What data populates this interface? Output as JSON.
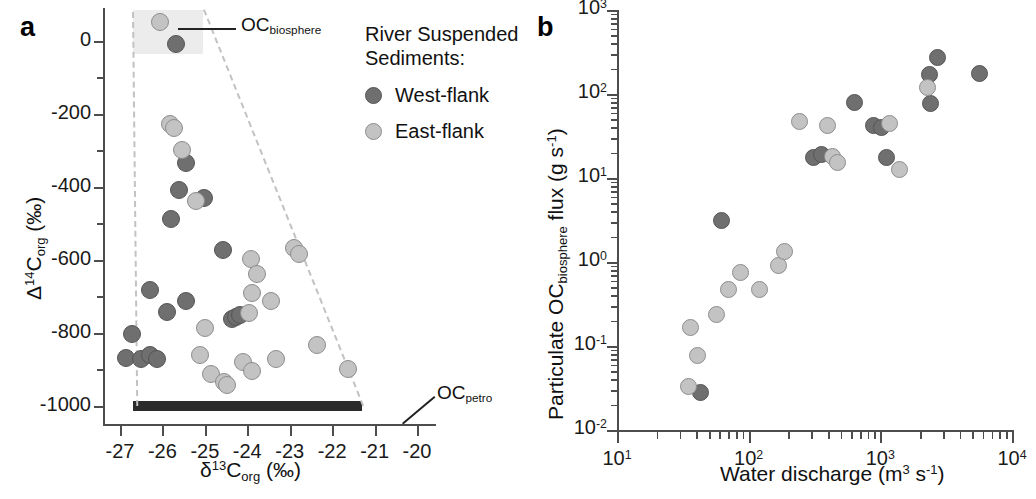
{
  "figure": {
    "panels": [
      {
        "letter": "a"
      },
      {
        "letter": "b"
      }
    ]
  },
  "legend": {
    "title_line1": "River Suspended",
    "title_line2": "Sediments:",
    "items": [
      {
        "label": "West-flank",
        "key": "west",
        "color": "#6f6f6f"
      },
      {
        "label": "East-flank",
        "key": "east",
        "color": "#c3c3c3"
      }
    ]
  },
  "panel_a": {
    "letter": "a",
    "annotations": [
      {
        "name": "oc-biosphere-label",
        "text_main": "OC",
        "text_sub": "biosphere"
      },
      {
        "name": "oc-petro-label",
        "text_main": "OC",
        "text_sub": "petro"
      }
    ],
    "x_axis": {
      "title_parts": {
        "delta": "δ",
        "sup": "13",
        "c": "C",
        "sub": "org",
        "units": "(‰)"
      },
      "ticks": [
        "-27",
        "-26",
        "-25",
        "-24",
        "-23",
        "-22",
        "-21",
        "-20"
      ],
      "min": -27.4,
      "max": -19.6
    },
    "y_axis": {
      "title_parts": {
        "delta": "Δ",
        "sup": "14",
        "c": "C",
        "sub": "org",
        "units": "(‰)"
      },
      "ticks": [
        "0",
        "-200",
        "-400",
        "-600",
        "-800",
        "-1000"
      ],
      "min": -1050,
      "max": 90
    }
  },
  "panel_b": {
    "letter": "b",
    "x_axis": {
      "title_parts": {
        "text": "Water discharge (m",
        "sup1": "3",
        "mid": " s",
        "sup2": "-1",
        "end": ")"
      },
      "ticks": [
        "10¹",
        "10²",
        "10³",
        "10⁴"
      ],
      "tick_exponents": [
        "1",
        "2",
        "3",
        "4"
      ],
      "min_exp": 1,
      "max_exp": 4
    },
    "y_axis": {
      "title_parts": {
        "lead": "Particulate OC",
        "sub": "biosphere",
        "tail": " flux (g s",
        "sup": "-1",
        "end": ")"
      },
      "ticks": [
        "10⁻²",
        "10⁻¹",
        "10⁰",
        "10¹",
        "10²",
        "10³"
      ],
      "tick_exponents": [
        "-2",
        "-1",
        "0",
        "1",
        "2",
        "3"
      ],
      "min_exp": -2,
      "max_exp": 3
    }
  },
  "chart_data": [
    {
      "type": "scatter",
      "panel": "a",
      "title": "",
      "xlabel": "δ13Corg (‰)",
      "ylabel": "Δ14Corg (‰)",
      "xlim": [
        -27.4,
        -19.6
      ],
      "ylim": [
        -1050,
        90
      ],
      "grid": false,
      "legend_position": "outside-right-top",
      "annotations": [
        {
          "label": "OCbiosphere",
          "x": -23.0,
          "y": 35,
          "note": "shaded endmember box upper-left"
        },
        {
          "label": "OCpetro",
          "x": -20.9,
          "y": -950,
          "note": "black bar along -1000 line"
        }
      ],
      "shaded_box": {
        "x0": -26.7,
        "x1": -25.05,
        "y0": -35,
        "y1": 85
      },
      "mixing_lines": [
        {
          "from": [
            -26.72,
            80
          ],
          "to": [
            -26.62,
            -1000
          ]
        },
        {
          "from": [
            -25.05,
            85
          ],
          "to": [
            -21.3,
            -1000
          ]
        }
      ],
      "petro_bar": {
        "x0": -26.7,
        "x1": -21.3,
        "y": -1000
      },
      "series": [
        {
          "name": "West-flank",
          "color": "#6f6f6f",
          "points": [
            [
              -25.68,
              -8
            ],
            [
              -25.45,
              -335
            ],
            [
              -25.62,
              -410
            ],
            [
              -25.02,
              -432
            ],
            [
              -25.8,
              -487
            ],
            [
              -24.58,
              -572
            ],
            [
              -26.3,
              -682
            ],
            [
              -25.45,
              -712
            ],
            [
              -25.9,
              -742
            ],
            [
              -24.36,
              -762
            ],
            [
              -24.26,
              -757
            ],
            [
              -24.17,
              -752
            ],
            [
              -26.72,
              -803
            ],
            [
              -26.85,
              -868
            ],
            [
              -26.5,
              -872
            ],
            [
              -26.3,
              -862
            ],
            [
              -26.12,
              -872
            ]
          ]
        },
        {
          "name": "East-flank",
          "color": "#c3c3c3",
          "points": [
            [
              -26.05,
              52
            ],
            [
              -25.82,
              -228
            ],
            [
              -25.72,
              -240
            ],
            [
              -25.55,
              -298
            ],
            [
              -25.22,
              -438
            ],
            [
              -23.92,
              -598
            ],
            [
              -22.9,
              -568
            ],
            [
              -22.78,
              -583
            ],
            [
              -23.78,
              -640
            ],
            [
              -23.9,
              -690
            ],
            [
              -23.45,
              -712
            ],
            [
              -23.97,
              -745
            ],
            [
              -25.0,
              -787
            ],
            [
              -25.12,
              -862
            ],
            [
              -22.35,
              -833
            ],
            [
              -23.32,
              -872
            ],
            [
              -21.62,
              -898
            ],
            [
              -24.86,
              -912
            ],
            [
              -24.1,
              -880
            ],
            [
              -23.9,
              -905
            ],
            [
              -24.55,
              -935
            ],
            [
              -24.48,
              -942
            ]
          ]
        }
      ]
    },
    {
      "type": "scatter",
      "panel": "b",
      "title": "",
      "xlabel": "Water discharge (m3 s-1)",
      "ylabel": "Particulate OCbiosphere flux (g s-1)",
      "x_log": true,
      "y_log": true,
      "xlim": [
        10,
        10000
      ],
      "ylim": [
        0.01,
        1000
      ],
      "grid": false,
      "series": [
        {
          "name": "West-flank",
          "color": "#6f6f6f",
          "points": [
            [
              43,
              0.028
            ],
            [
              62,
              3.1
            ],
            [
              310,
              17.5
            ],
            [
              355,
              19.0
            ],
            [
              640,
              80
            ],
            [
              880,
              42
            ],
            [
              1020,
              40
            ],
            [
              1120,
              17.5
            ],
            [
              2350,
              170
            ],
            [
              2700,
              270
            ],
            [
              2400,
              78
            ],
            [
              5700,
              175
            ]
          ]
        },
        {
          "name": "East-flank",
          "color": "#c3c3c3",
          "points": [
            [
              35,
              0.033
            ],
            [
              41,
              0.077
            ],
            [
              36,
              0.165
            ],
            [
              57,
              0.24
            ],
            [
              70,
              0.47
            ],
            [
              86,
              0.76
            ],
            [
              120,
              0.47
            ],
            [
              168,
              0.9
            ],
            [
              188,
              1.35
            ],
            [
              245,
              47
            ],
            [
              395,
              42
            ],
            [
              430,
              18.0
            ],
            [
              470,
              15.5
            ],
            [
              1180,
              45
            ],
            [
              1400,
              12.5
            ],
            [
              2300,
              120
            ]
          ]
        }
      ]
    }
  ]
}
